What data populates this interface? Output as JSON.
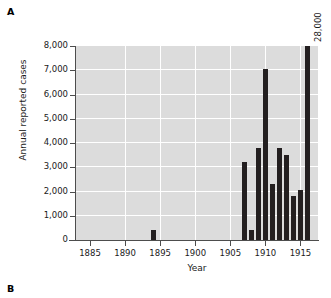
{
  "figure": {
    "panel_a_label": "A",
    "panel_b_label": "B",
    "truncated_bar_annotation": "28,000"
  },
  "colors": {
    "plot_background": "#dcdcdc",
    "gridline": "#ffffff",
    "bar": "#231f20",
    "axis": "#4d4d4d",
    "text": "#1a1a1a",
    "page_background": "#ffffff"
  },
  "chart_data": {
    "type": "bar",
    "title": "",
    "xlabel": "Year",
    "ylabel": "Annual reported cases",
    "xlim": [
      1883,
      1917.5
    ],
    "ylim": [
      0,
      8000
    ],
    "grid": true,
    "legend": "none",
    "y_ticks": [
      0,
      1000,
      2000,
      3000,
      4000,
      5000,
      6000,
      7000,
      8000
    ],
    "y_tick_labels": [
      "0",
      "1,000",
      "2,000",
      "3,000",
      "4,000",
      "5,000",
      "6,000",
      "7,000",
      "8,000"
    ],
    "x_ticks": [
      1885,
      1890,
      1895,
      1900,
      1905,
      1910,
      1915
    ],
    "x_tick_labels": [
      "1885",
      "1890",
      "1895",
      "1900",
      "1905",
      "1910",
      "1915"
    ],
    "x_minor_gridlines": [
      1890,
      1895,
      1900,
      1905,
      1910,
      1915
    ],
    "annotations": [
      {
        "text": "28,000",
        "x": 1916,
        "note": "value of clipped bar exceeding axis maximum"
      }
    ],
    "categories": [
      1894,
      1907,
      1908,
      1909,
      1910,
      1911,
      1912,
      1913,
      1914,
      1915,
      1916
    ],
    "values": [
      420,
      3220,
      410,
      3800,
      7050,
      2290,
      3790,
      3520,
      1800,
      2080,
      28000
    ],
    "clipped": [
      false,
      false,
      false,
      false,
      false,
      false,
      false,
      false,
      false,
      false,
      true
    ]
  }
}
